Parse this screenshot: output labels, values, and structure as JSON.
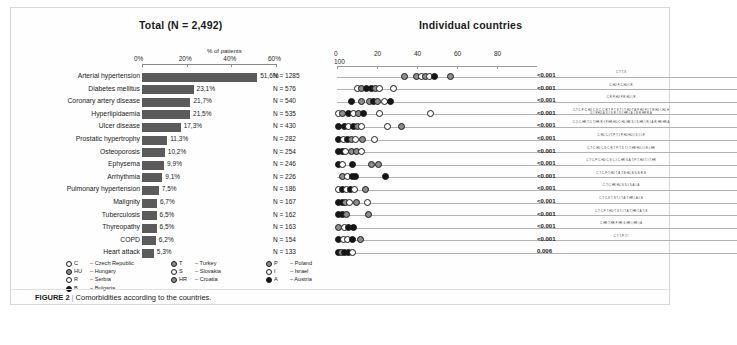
{
  "figure": {
    "caption_label": "FIGURE 2",
    "caption_separator": "|",
    "caption_text": "Comorbidities according to the countries."
  },
  "left_panel": {
    "title": "Total (N = 2,492)",
    "axis_caption": "% of patients",
    "ticks": [
      "0%",
      "20%",
      "40%",
      "60%"
    ]
  },
  "right_panel": {
    "title": "Individual countries",
    "ticks": [
      "0",
      "20",
      "40",
      "60",
      "80"
    ],
    "extra_tick": "100"
  },
  "legend": {
    "items": [
      {
        "code": "C",
        "name": "Czech Republic",
        "fill": "w"
      },
      {
        "code": "HU",
        "name": "Hungary",
        "fill": "g"
      },
      {
        "code": "R",
        "name": "Serbia",
        "fill": "w"
      },
      {
        "code": "B",
        "name": "Bulgaria",
        "fill": "k"
      },
      {
        "code": "T",
        "name": "Turkey",
        "fill": "g"
      },
      {
        "code": "S",
        "name": "Slovakia",
        "fill": "w"
      },
      {
        "code": "HR",
        "name": "Croatia",
        "fill": "g"
      },
      {
        "code": "P",
        "name": "Poland",
        "fill": "g"
      },
      {
        "code": "I",
        "name": "Israel",
        "fill": "w"
      },
      {
        "code": "A",
        "name": "Austria",
        "fill": "k"
      }
    ]
  },
  "chart_data": {
    "type": "bar",
    "title": "Comorbidities according to the countries",
    "xlabel": "% of patients",
    "ylabel": "",
    "xlim": [
      0,
      60
    ],
    "grid": false,
    "categories": [
      "Arterial hypertension",
      "Diabetes mellitus",
      "Coronary artery disease",
      "Hyperlipidaemia",
      "Ulcer disease",
      "Prostatic hypertrophy",
      "Osteoporosis",
      "Ephysema",
      "Arrhythmia",
      "Pulmonary hypertension",
      "Malignity",
      "Tuberculosis",
      "Thyreopathy",
      "COPD",
      "Heart attack"
    ],
    "values": [
      51.6,
      23.1,
      21.7,
      21.5,
      17.3,
      11.3,
      10.2,
      9.9,
      9.1,
      7.5,
      6.7,
      6.5,
      6.5,
      6.2,
      5.3
    ],
    "value_labels": [
      "51,6%",
      "23,1%",
      "21,7%",
      "21,5%",
      "17,3%",
      "11,3%",
      "10,2%",
      "9,9%",
      "9,1%",
      "7,5%",
      "6,7%",
      "6,5%",
      "6,5%",
      "6,2%",
      "5,3%"
    ],
    "n_labels": [
      "N = 1285",
      "N = 576",
      "N = 540",
      "N = 535",
      "N = 430",
      "N = 282",
      "N = 254",
      "N = 246",
      "N = 226",
      "N = 186",
      "N = 167",
      "N = 162",
      "N = 163",
      "N = 154",
      "N = 133"
    ],
    "p_values": [
      "<0.001",
      "<0.001",
      "<0.001",
      "<0.001",
      "<0.001",
      "<0.001",
      "<0.001",
      "<0.001",
      "<0.001",
      "<0.001",
      "<0.001",
      "<0.001",
      "<0.001",
      "<0.001",
      "0.006"
    ],
    "country_code_notes": [
      "C, T; T, S",
      "C, HU; P, C, HU; I, R",
      "C, R; P, HU; P, R, HU; I, R",
      "C, T; C, P; C, HU; C, S; C, C, R; T, P; T, S; T, I; T, HU; T, A; P, HU; P, I; T, R; HU; I, HU; HU, I; R HU, A; S, I; S, R; I, S; I, HR; I, A; I, B; R, HR; R, A",
      "C, C; C, HR; T, C; T, HR; R, I; P, HR; HU, C; HU, HR; S, I; S, HR; I, R; I, A; R, HR; HR, A",
      "C, HU; C, I; T, P; T, I; P, HU; HU, I; S, I; I, R",
      "C, T; C, HU; C, S; C, R; T, P; T, S; T, I; T, HR; HU, I; I, R; I, HR",
      "C, T; C, P; C, HU; C, S; C, I; C, HR; S, A; T, P; T, HU; T, I; T, HR",
      "C, T; C, P; T, HU; T, A; T, B; HU, B; S, B; R, B",
      "C, T; C, HR; HU, S; S, I; S, A; I, A",
      "C, T; C, S; T, S; T, I; T, A; T, HR; I, A; I, B",
      "C, T; C, P; T, HU; T, S; T, I; T, A; T, HR; T, A; T, B",
      "C, HR; T, HR; P, HR; S, HR; I, HR; I, A",
      "C, T; T, P; T, I"
    ]
  },
  "dot_rows": [
    {
      "line_end": 200,
      "dots": [
        {
          "x": 33.5,
          "fill": "g"
        },
        {
          "x": 39.5,
          "fill": "g"
        },
        {
          "x": 42.0,
          "fill": "w"
        },
        {
          "x": 44.0,
          "fill": "g"
        },
        {
          "x": 46.0,
          "fill": "w"
        },
        {
          "x": 48.5,
          "fill": "k"
        },
        {
          "x": 56.5,
          "fill": "g"
        }
      ]
    },
    {
      "line_end": 200,
      "dots": [
        {
          "x": 10.0,
          "fill": "w"
        },
        {
          "x": 12.0,
          "fill": "g"
        },
        {
          "x": 14.5,
          "fill": "k"
        },
        {
          "x": 17.0,
          "fill": "k"
        },
        {
          "x": 19.0,
          "fill": "g"
        },
        {
          "x": 21.0,
          "fill": "w"
        },
        {
          "x": 28.0,
          "fill": "w"
        }
      ]
    },
    {
      "line_end": 200,
      "dots": [
        {
          "x": 7.0,
          "fill": "k"
        },
        {
          "x": 12.0,
          "fill": "g"
        },
        {
          "x": 16.0,
          "fill": "g"
        },
        {
          "x": 18.0,
          "fill": "k"
        },
        {
          "x": 20.0,
          "fill": "g"
        },
        {
          "x": 23.5,
          "fill": "w"
        },
        {
          "x": 26.5,
          "fill": "k"
        }
      ]
    },
    {
      "line_end": 200,
      "dots": [
        {
          "x": 0.5,
          "fill": "w"
        },
        {
          "x": 2.5,
          "fill": "g"
        },
        {
          "x": 5.5,
          "fill": "k"
        },
        {
          "x": 8.0,
          "fill": "w"
        },
        {
          "x": 10.5,
          "fill": "g"
        },
        {
          "x": 13.0,
          "fill": "k"
        },
        {
          "x": 21.0,
          "fill": "w"
        },
        {
          "x": 46.5,
          "fill": "w"
        }
      ]
    },
    {
      "line_end": 200,
      "dots": [
        {
          "x": 0.5,
          "fill": "k"
        },
        {
          "x": 3.5,
          "fill": "k"
        },
        {
          "x": 5.5,
          "fill": "w"
        },
        {
          "x": 8.0,
          "fill": "k"
        },
        {
          "x": 10.0,
          "fill": "g"
        },
        {
          "x": 12.0,
          "fill": "w"
        },
        {
          "x": 25.0,
          "fill": "w"
        },
        {
          "x": 32.0,
          "fill": "g"
        }
      ]
    },
    {
      "line_end": 200,
      "dots": [
        {
          "x": 0.5,
          "fill": "k"
        },
        {
          "x": 3.0,
          "fill": "w"
        },
        {
          "x": 5.0,
          "fill": "k"
        },
        {
          "x": 7.0,
          "fill": "g"
        },
        {
          "x": 9.0,
          "fill": "w"
        },
        {
          "x": 12.5,
          "fill": "g"
        },
        {
          "x": 18.5,
          "fill": "w"
        }
      ]
    },
    {
      "line_end": 200,
      "dots": [
        {
          "x": 0.5,
          "fill": "k"
        },
        {
          "x": 2.5,
          "fill": "k"
        },
        {
          "x": 4.0,
          "fill": "w"
        },
        {
          "x": 7.0,
          "fill": "g"
        },
        {
          "x": 9.5,
          "fill": "g"
        },
        {
          "x": 12.0,
          "fill": "w"
        }
      ]
    },
    {
      "line_end": 200,
      "dots": [
        {
          "x": 0.5,
          "fill": "k"
        },
        {
          "x": 2.5,
          "fill": "w"
        },
        {
          "x": 7.5,
          "fill": "k"
        },
        {
          "x": 17.0,
          "fill": "g"
        },
        {
          "x": 20.5,
          "fill": "g"
        }
      ]
    },
    {
      "line_end": 200,
      "dots": [
        {
          "x": 2.5,
          "fill": "g"
        },
        {
          "x": 5.0,
          "fill": "w"
        },
        {
          "x": 7.5,
          "fill": "k"
        },
        {
          "x": 9.0,
          "fill": "k"
        },
        {
          "x": 24.0,
          "fill": "k"
        }
      ]
    },
    {
      "line_end": 200,
      "dots": [
        {
          "x": 0.5,
          "fill": "w"
        },
        {
          "x": 2.5,
          "fill": "k"
        },
        {
          "x": 4.5,
          "fill": "w"
        },
        {
          "x": 6.5,
          "fill": "k"
        },
        {
          "x": 8.5,
          "fill": "w"
        },
        {
          "x": 14.0,
          "fill": "g"
        }
      ]
    },
    {
      "line_end": 200,
      "dots": [
        {
          "x": 0.5,
          "fill": "k"
        },
        {
          "x": 2.5,
          "fill": "k"
        },
        {
          "x": 4.0,
          "fill": "g"
        },
        {
          "x": 6.0,
          "fill": "w"
        },
        {
          "x": 9.5,
          "fill": "g"
        },
        {
          "x": 15.0,
          "fill": "w"
        }
      ]
    },
    {
      "line_end": 200,
      "dots": [
        {
          "x": 0.5,
          "fill": "k"
        },
        {
          "x": 2.5,
          "fill": "k"
        },
        {
          "x": 4.5,
          "fill": "g"
        },
        {
          "x": 15.5,
          "fill": "g"
        }
      ]
    },
    {
      "line_end": 200,
      "dots": [
        {
          "x": 0.5,
          "fill": "g"
        },
        {
          "x": 3.5,
          "fill": "w"
        },
        {
          "x": 5.5,
          "fill": "k"
        },
        {
          "x": 8.0,
          "fill": "k"
        }
      ]
    },
    {
      "line_end": 200,
      "dots": [
        {
          "x": 0.5,
          "fill": "k"
        },
        {
          "x": 3.0,
          "fill": "w"
        },
        {
          "x": 5.0,
          "fill": "w"
        },
        {
          "x": 7.5,
          "fill": "k"
        },
        {
          "x": 11.5,
          "fill": "g"
        }
      ]
    },
    {
      "line_end": 200,
      "dots": [
        {
          "x": 0.5,
          "fill": "k"
        },
        {
          "x": 2.0,
          "fill": "g"
        },
        {
          "x": 3.5,
          "fill": "k"
        },
        {
          "x": 5.5,
          "fill": "k"
        },
        {
          "x": 7.5,
          "fill": "w"
        }
      ]
    }
  ]
}
